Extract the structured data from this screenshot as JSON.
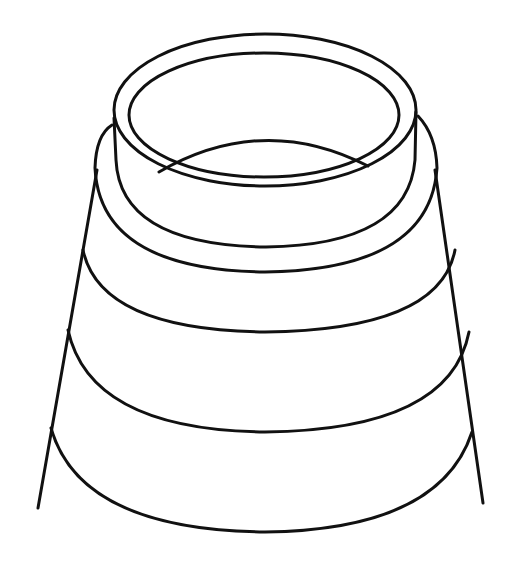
{
  "figure": {
    "stroke_color": "#111111",
    "background": "#ffffff",
    "bands": 4
  }
}
